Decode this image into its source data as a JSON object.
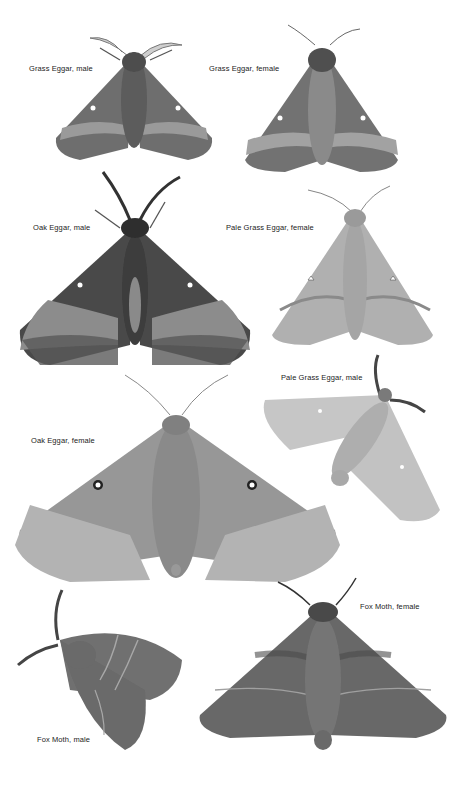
{
  "plate": {
    "background": "#ffffff",
    "specimens": [
      {
        "id": "grass-eggar-male",
        "label": "Grass Eggar, male"
      },
      {
        "id": "grass-eggar-female",
        "label": "Grass Eggar, female"
      },
      {
        "id": "oak-eggar-male",
        "label": "Oak Eggar, male"
      },
      {
        "id": "pale-grass-eggar-female",
        "label": "Pale Grass Eggar, female"
      },
      {
        "id": "pale-grass-eggar-male",
        "label": "Pale Grass Eggar, male"
      },
      {
        "id": "oak-eggar-female",
        "label": "Oak Eggar, female"
      },
      {
        "id": "fox-moth-male",
        "label": "Fox Moth, male"
      },
      {
        "id": "fox-moth-female",
        "label": "Fox Moth, female"
      }
    ]
  }
}
